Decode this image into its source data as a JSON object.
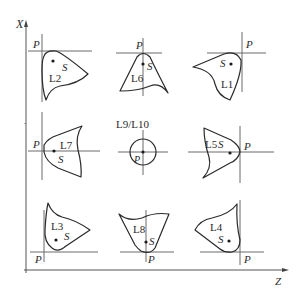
{
  "axes": {
    "vertical_label": "X",
    "horizontal_label": "Z"
  },
  "marker_label": "P",
  "centroid_label": "S",
  "cells": [
    {
      "id": "L2",
      "position": "top-left"
    },
    {
      "id": "L6",
      "position": "top-center"
    },
    {
      "id": "L1",
      "position": "top-right"
    },
    {
      "id": "L7",
      "position": "middle-left"
    },
    {
      "id": "L9/L10",
      "position": "center"
    },
    {
      "id": "L5",
      "position": "middle-right"
    },
    {
      "id": "L3",
      "position": "bottom-left"
    },
    {
      "id": "L8",
      "position": "bottom-center"
    },
    {
      "id": "L4",
      "position": "bottom-right"
    }
  ],
  "labels": {
    "L1": "L1",
    "L2": "L2",
    "L3": "L3",
    "L4": "L4",
    "L5": "L5",
    "L6": "L6",
    "L7": "L7",
    "L8": "L8",
    "L9_L10": "L9/L10"
  }
}
